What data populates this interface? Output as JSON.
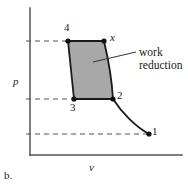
{
  "figure": {
    "caption": "b.",
    "axes": {
      "x_label": "v",
      "y_label": "p"
    },
    "annotation": {
      "line1": "work",
      "line2": "reduction"
    },
    "points": [
      {
        "id": "4",
        "label": "4",
        "x": 68,
        "y": 41
      },
      {
        "id": "x",
        "label": "x",
        "x": 104,
        "y": 41
      },
      {
        "id": "3",
        "label": "3",
        "x": 74,
        "y": 99
      },
      {
        "id": "2",
        "label": "2",
        "x": 113,
        "y": 99
      },
      {
        "id": "1",
        "label": "1",
        "x": 149,
        "y": 134
      }
    ],
    "colors": {
      "shade_fill": "#a8a8a8",
      "curve_stroke": "#1a1a1a",
      "axis_stroke": "#555555",
      "dash_stroke": "#555555",
      "text": "#1a1a1a"
    },
    "geometry": {
      "y_axis_x": 30,
      "y_axis_top": 8,
      "x_axis_y": 155,
      "x_axis_right": 182,
      "dash_levels": [
        41,
        99,
        134
      ],
      "leader_line": {
        "x1": 93,
        "y1": 62,
        "x2": 136,
        "y2": 52
      }
    }
  }
}
